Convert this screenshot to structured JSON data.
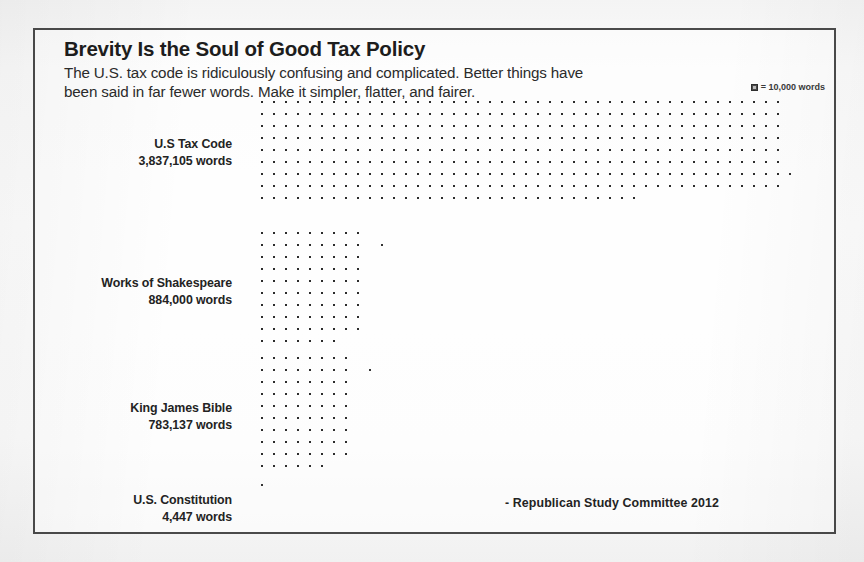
{
  "header": {
    "title": "Brevity Is the Soul of Good Tax Policy",
    "subtitle_line1": "The U.S. tax code is ridiculously confusing and complicated. Better things have",
    "subtitle_line2": "been said in far fewer words. Make it simpler, flatter, and fairer.",
    "legend_text": "= 10,000 words"
  },
  "attribution": "- Republican Study Committee  2012",
  "chart_data": {
    "type": "bar",
    "subtype": "pictogram-isotype",
    "title": "Brevity Is the Soul of Good Tax Policy",
    "subtitle": "The U.S. tax code is ridiculously confusing and complicated. Better things have been said in far fewer words. Make it simpler, flatter, and fairer.",
    "unit_label": "= 10,000 words",
    "unit_value": 10000,
    "xlabel": "",
    "ylabel": "",
    "grid": false,
    "legend_position": "top-right",
    "source": "- Republican Study Committee  2012",
    "categories": [
      "U.S Tax Code",
      "Works of Shakespeare",
      "King James Bible",
      "U.S. Constitution"
    ],
    "values": [
      3837105,
      884000,
      783137,
      4447
    ],
    "value_labels": [
      "3,837,105 words",
      "884,000 words",
      "783,137 words",
      "4,447 words"
    ],
    "icon_counts": [
      384,
      88,
      78,
      1
    ],
    "rows": [
      {
        "name": "U.S Tax Code",
        "count_label": "3,837,105 words",
        "value": 3837105,
        "icons": 384,
        "columns": 44,
        "grid_rows": 10,
        "stray_marks": [
          {
            "row": 6,
            "col": 44
          }
        ]
      },
      {
        "name": "Works of Shakespeare",
        "count_label": "884,000 words",
        "value": 884000,
        "icons": 88,
        "columns": 9,
        "grid_rows": 10,
        "stray_marks": [
          {
            "row": 1,
            "col": 10
          }
        ]
      },
      {
        "name": "King James Bible",
        "count_label": "783,137 words",
        "value": 783137,
        "icons": 78,
        "columns": 8,
        "grid_rows": 10,
        "stray_marks": [
          {
            "row": 1,
            "col": 9
          }
        ]
      },
      {
        "name": "U.S. Constitution",
        "count_label": "4,447 words",
        "value": 4447,
        "icons": 1,
        "columns": 1,
        "grid_rows": 1,
        "stray_marks": []
      }
    ]
  }
}
